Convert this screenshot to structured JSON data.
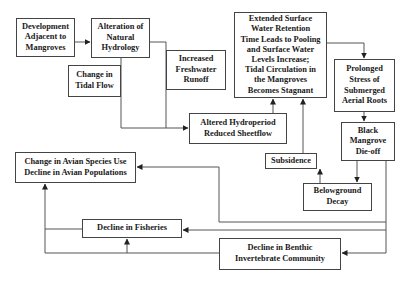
{
  "diagram": {
    "nodes": {
      "development": "Development\nAdjacent to\nMangroves",
      "alteration": "Alteration of\nNatural\nHydrology",
      "tidal_flow": "Change in\nTidal Flow",
      "freshwater": "Increased\nFreshwater\nRunoff",
      "hydroperiod": "Altered Hydroperiod\nReduced Sheetflow",
      "extended": "Extended Surface\nWater Retention\nTime Leads to Pooling\nand Surface Water\nLevels Increase;\nTidal Circulation in\nthe Mangroves\nBecomes Stagnant",
      "prolonged": "Prolonged\nStress of\nSubmerged\nAerial Roots",
      "black_mangrove": "Black\nMangrove\nDie-off",
      "subsidence": "Subsidence",
      "belowground": "Belowground\nDecay",
      "avian": "Change in Avian Species Use\nDecline in Avian Populations",
      "fisheries": "Decline in Fisheries",
      "benthic": "Decline in Benthic\nInvertebrate Community"
    },
    "edges": [
      {
        "from": "development",
        "to": "alteration"
      },
      {
        "from": "alteration",
        "to": "hydroperiod"
      },
      {
        "from": "tidal_flow",
        "to": "hydroperiod"
      },
      {
        "from": "freshwater",
        "to": "hydroperiod"
      },
      {
        "from": "hydroperiod",
        "to": "extended"
      },
      {
        "from": "extended",
        "to": "prolonged"
      },
      {
        "from": "prolonged",
        "to": "black_mangrove"
      },
      {
        "from": "black_mangrove",
        "to": "belowground"
      },
      {
        "from": "belowground",
        "to": "subsidence"
      },
      {
        "from": "subsidence",
        "to": "extended"
      },
      {
        "from": "black_mangrove",
        "to": "avian"
      },
      {
        "from": "black_mangrove",
        "to": "fisheries"
      },
      {
        "from": "black_mangrove",
        "to": "benthic"
      },
      {
        "from": "benthic",
        "to": "fisheries"
      },
      {
        "from": "benthic",
        "to": "avian"
      },
      {
        "from": "fisheries",
        "to": "avian"
      }
    ],
    "colors": {
      "line": "#444444",
      "box_border": "#444444",
      "text": "#1a1a1a",
      "background": "#ffffff"
    }
  }
}
